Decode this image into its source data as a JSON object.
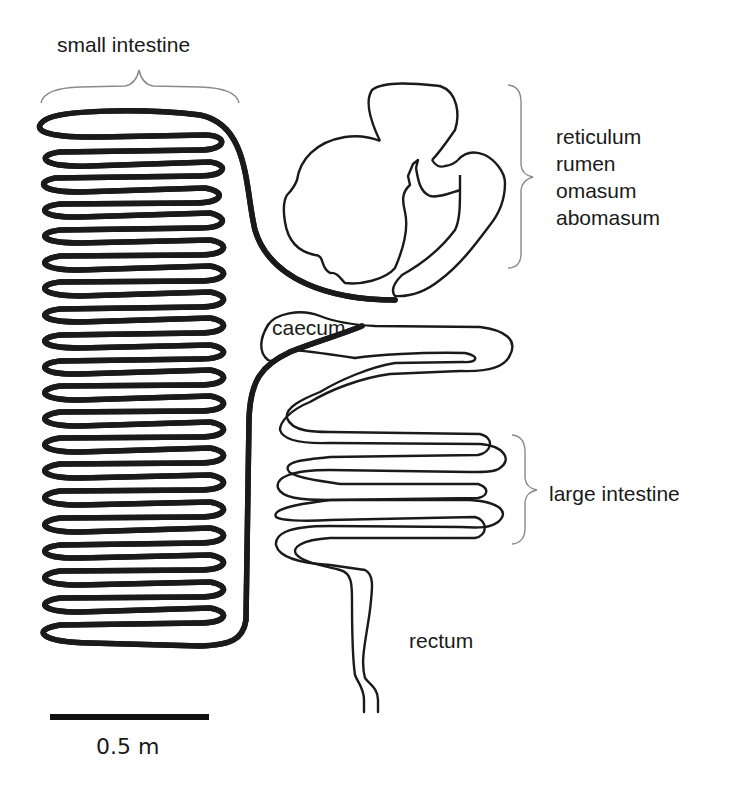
{
  "diagram": {
    "labels": {
      "small_intestine": "small intestine",
      "stomach": [
        "reticulum",
        "rumen",
        "omasum",
        "abomasum"
      ],
      "caecum": "caecum",
      "large_intestine": "large intestine",
      "rectum": "rectum"
    },
    "scale_bar": {
      "label": "0.5 m",
      "length_px": 158
    },
    "colors": {
      "stroke": "#1a1a1a",
      "brace": "#8a8a8a",
      "background": "#ffffff"
    }
  }
}
